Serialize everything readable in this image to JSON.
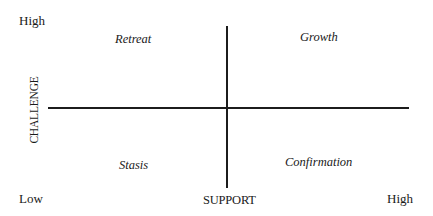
{
  "diagram": {
    "type": "quadrant",
    "axes": {
      "x": {
        "title": "SUPPORT",
        "low_label": "Low",
        "high_label": "High"
      },
      "y": {
        "title": "CHALLENGE",
        "high_label": "High"
      }
    },
    "quadrants": {
      "top_left": "Retreat",
      "top_right": "Growth",
      "bottom_left": "Stasis",
      "bottom_right": "Confirmation"
    }
  }
}
